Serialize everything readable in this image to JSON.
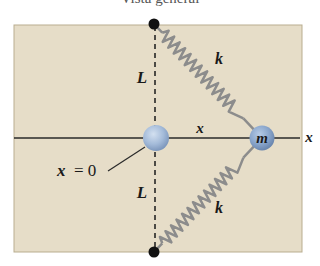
{
  "title": "Vista general",
  "labels": {
    "top_length": "L",
    "bottom_length": "L",
    "top_spring": "k",
    "bottom_spring": "k",
    "displacement": "x",
    "axis": "x",
    "mass": "m",
    "origin_var": "x",
    "origin_eq": "= 0"
  },
  "colors": {
    "background": "#e6ddc8",
    "border": "#b9ad8f",
    "spring": "#8c8c8c",
    "ball": "#a9bfdc",
    "line": "#2a2a2a"
  }
}
